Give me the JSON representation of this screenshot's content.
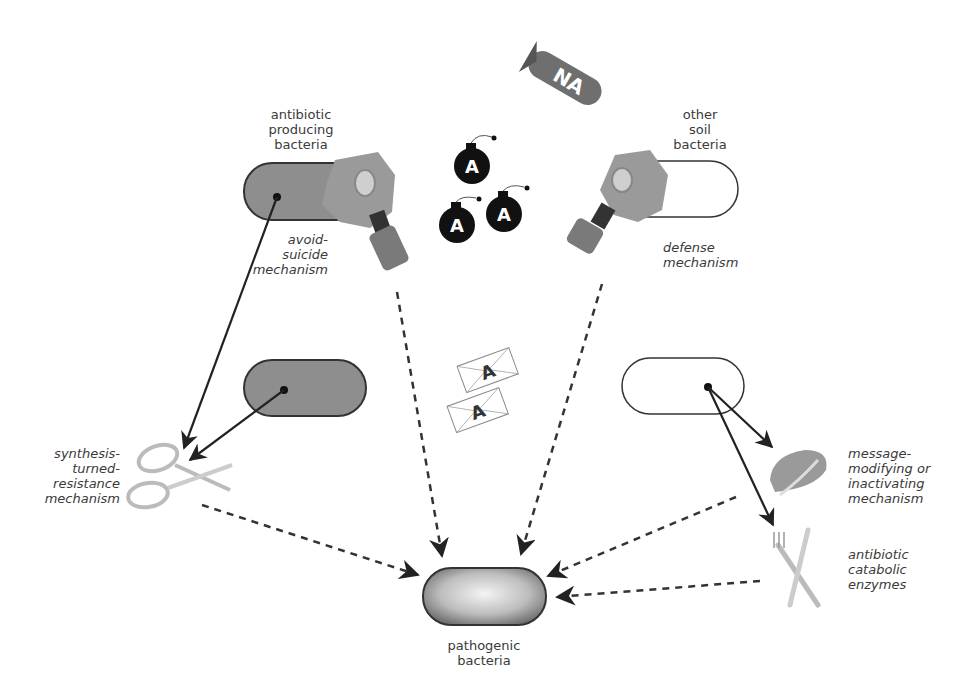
{
  "labels": {
    "antibiotic_producing": [
      "antibiotic",
      "producing",
      "bacteria"
    ],
    "other_soil": [
      "other",
      "soil",
      "bacteria"
    ],
    "avoid_suicide": [
      "avoid-",
      "suicide",
      "mechanism"
    ],
    "defense": [
      "defense",
      "mechanism"
    ],
    "synthesis_turned": [
      "synthesis-",
      "turned-",
      "resistance",
      "mechanism"
    ],
    "message_modifying": [
      "message-",
      "modifying or",
      "inactivating",
      "mechanism"
    ],
    "catabolic": [
      "antibiotic",
      "catabolic",
      "enzymes"
    ],
    "pathogenic": [
      "pathogenic",
      "bacteria"
    ]
  },
  "icons": {
    "dna_bomb_text": "NA",
    "bomb_letter": "A",
    "envelope_letter": "A"
  },
  "colors": {
    "gray_fill": "#8e8e8e",
    "outline": "#333333",
    "arrow": "#222222",
    "mask": "#9a9a9a"
  }
}
